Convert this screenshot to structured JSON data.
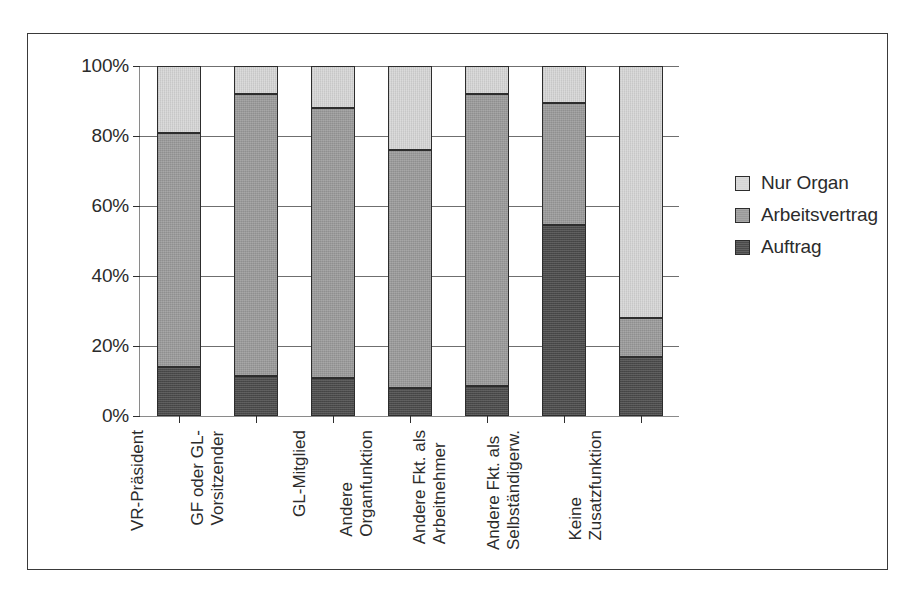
{
  "chart_data": {
    "type": "bar",
    "subtype": "stacked-percent",
    "title": "",
    "xlabel": "",
    "ylabel": "",
    "ylim": [
      0,
      100
    ],
    "ytick_labels": [
      "100%",
      "80%",
      "60%",
      "40%",
      "20%",
      "0%"
    ],
    "ytick_values": [
      100,
      80,
      60,
      40,
      20,
      0
    ],
    "grid": true,
    "legend_position": "right",
    "categories": [
      "VR-Präsident",
      "GF oder GL-Vorsitzender",
      "GL-Mitglied",
      "Andere Organfunktion",
      "Andere Fkt. als Arbeitnehmer",
      "Andere Fkt. als Selbständigerw.",
      "Keine Zusatzfunktion"
    ],
    "category_lines": [
      [
        "VR-Präsident"
      ],
      [
        "GF oder GL-",
        "Vorsitzender"
      ],
      [
        "GL-Mitglied"
      ],
      [
        "Andere",
        "Organfunktion"
      ],
      [
        "Andere Fkt. als",
        "Arbeitnehmer"
      ],
      [
        "Andere Fkt. als",
        "Selbständigerw."
      ],
      [
        "Keine",
        "Zusatzfunktion"
      ]
    ],
    "series": [
      {
        "name": "Auftrag",
        "color": "#4a4a4a",
        "values": [
          14,
          11.5,
          11,
          8,
          8.5,
          54.5,
          17
        ]
      },
      {
        "name": "Arbeitsvertrag",
        "color": "#9a9a9a",
        "values": [
          67,
          80.5,
          77,
          68,
          83.5,
          35,
          11
        ]
      },
      {
        "name": "Nur Organ",
        "color": "#d6d6d6",
        "values": [
          19,
          8,
          12,
          24,
          8,
          10.5,
          72
        ]
      }
    ],
    "cumulative_tops": [
      [
        14,
        81,
        100
      ],
      [
        11.5,
        92,
        100
      ],
      [
        11,
        88,
        100
      ],
      [
        8,
        76,
        100
      ],
      [
        8.5,
        92,
        100
      ],
      [
        54.5,
        89.5,
        100
      ],
      [
        17,
        28,
        100
      ]
    ]
  },
  "legend": {
    "entries": [
      {
        "label": "Nur Organ",
        "color": "#d6d6d6"
      },
      {
        "label": "Arbeitsvertrag",
        "color": "#9a9a9a"
      },
      {
        "label": "Auftrag",
        "color": "#4a4a4a"
      }
    ]
  }
}
